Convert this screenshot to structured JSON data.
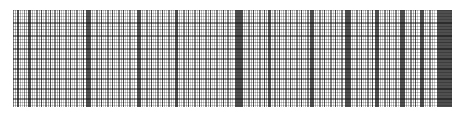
{
  "image": {
    "kind": "barcode-strip",
    "width": 464,
    "height": 120,
    "background_color": "#ffffff",
    "alt_text": "Dense vertical barcode-like stripe pattern crossed by faint horizontal grid rules"
  },
  "plot": {
    "x": 13,
    "y": 10,
    "width": 439,
    "height": 97,
    "background_color": "#ffffff"
  },
  "palette": {
    "background": "#ffffff",
    "lightest_bar": "#c9c9c9",
    "light_bar": "#b4b4b4",
    "mid_bar": "#969696",
    "dark_bar": "#6e6e6e",
    "darkest_bar": "#4f4f4f",
    "rule": "#8c8c8c"
  },
  "chart_data": {
    "type": "bar",
    "title": "",
    "subtitle": "",
    "xlabel": "",
    "ylabel": "",
    "grid": true,
    "legend": "none",
    "xlim": [
      13,
      452
    ],
    "ylim": [
      10,
      107
    ],
    "tick_labels_x": [],
    "tick_labels_y": [],
    "annotations": [],
    "bar_axis": "vertical",
    "bar_span_y": [
      10,
      107
    ],
    "bars": [
      [
        13,
        1,
        3
      ],
      [
        15,
        1,
        2
      ],
      [
        17,
        2,
        4
      ],
      [
        20,
        1,
        2
      ],
      [
        22,
        1,
        1
      ],
      [
        24,
        1,
        3
      ],
      [
        26,
        1,
        2
      ],
      [
        28,
        3,
        4
      ],
      [
        32,
        1,
        2
      ],
      [
        34,
        1,
        1
      ],
      [
        36,
        2,
        3
      ],
      [
        39,
        1,
        2
      ],
      [
        41,
        1,
        4
      ],
      [
        43,
        1,
        1
      ],
      [
        45,
        2,
        3
      ],
      [
        48,
        1,
        2
      ],
      [
        50,
        1,
        4
      ],
      [
        52,
        1,
        1
      ],
      [
        54,
        2,
        3
      ],
      [
        57,
        1,
        2
      ],
      [
        59,
        1,
        4
      ],
      [
        61,
        1,
        2
      ],
      [
        63,
        1,
        1
      ],
      [
        65,
        2,
        3
      ],
      [
        68,
        1,
        2
      ],
      [
        70,
        1,
        4
      ],
      [
        72,
        1,
        1
      ],
      [
        74,
        1,
        2
      ],
      [
        76,
        2,
        3
      ],
      [
        79,
        1,
        1
      ],
      [
        81,
        1,
        2
      ],
      [
        83,
        1,
        4
      ],
      [
        86,
        5,
        4
      ],
      [
        92,
        1,
        2
      ],
      [
        94,
        1,
        1
      ],
      [
        96,
        2,
        3
      ],
      [
        99,
        1,
        2
      ],
      [
        101,
        1,
        4
      ],
      [
        103,
        1,
        1
      ],
      [
        105,
        1,
        2
      ],
      [
        107,
        2,
        3
      ],
      [
        110,
        1,
        1
      ],
      [
        112,
        1,
        4
      ],
      [
        114,
        1,
        2
      ],
      [
        116,
        1,
        1
      ],
      [
        118,
        2,
        3
      ],
      [
        121,
        1,
        2
      ],
      [
        123,
        1,
        4
      ],
      [
        125,
        1,
        1
      ],
      [
        127,
        1,
        2
      ],
      [
        129,
        2,
        3
      ],
      [
        132,
        1,
        1
      ],
      [
        134,
        1,
        2
      ],
      [
        137,
        4,
        4
      ],
      [
        142,
        1,
        2
      ],
      [
        144,
        1,
        1
      ],
      [
        146,
        2,
        3
      ],
      [
        149,
        1,
        2
      ],
      [
        151,
        1,
        4
      ],
      [
        153,
        1,
        1
      ],
      [
        155,
        1,
        2
      ],
      [
        157,
        2,
        3
      ],
      [
        160,
        1,
        1
      ],
      [
        162,
        1,
        4
      ],
      [
        164,
        1,
        2
      ],
      [
        166,
        1,
        1
      ],
      [
        168,
        2,
        3
      ],
      [
        171,
        1,
        2
      ],
      [
        173,
        1,
        1
      ],
      [
        175,
        3,
        4
      ],
      [
        179,
        1,
        2
      ],
      [
        181,
        1,
        1
      ],
      [
        183,
        2,
        3
      ],
      [
        186,
        1,
        2
      ],
      [
        188,
        1,
        4
      ],
      [
        190,
        1,
        1
      ],
      [
        192,
        1,
        2
      ],
      [
        194,
        2,
        3
      ],
      [
        197,
        1,
        1
      ],
      [
        199,
        1,
        4
      ],
      [
        201,
        1,
        2
      ],
      [
        203,
        1,
        1
      ],
      [
        205,
        2,
        3
      ],
      [
        208,
        1,
        2
      ],
      [
        210,
        1,
        4
      ],
      [
        212,
        1,
        1
      ],
      [
        214,
        1,
        2
      ],
      [
        216,
        2,
        3
      ],
      [
        219,
        1,
        1
      ],
      [
        221,
        1,
        2
      ],
      [
        223,
        1,
        4
      ],
      [
        225,
        1,
        1
      ],
      [
        227,
        2,
        3
      ],
      [
        230,
        1,
        2
      ],
      [
        232,
        1,
        1
      ],
      [
        235,
        8,
        4
      ],
      [
        244,
        1,
        2
      ],
      [
        246,
        1,
        1
      ],
      [
        248,
        2,
        3
      ],
      [
        251,
        1,
        2
      ],
      [
        253,
        1,
        4
      ],
      [
        255,
        1,
        1
      ],
      [
        257,
        1,
        2
      ],
      [
        259,
        2,
        3
      ],
      [
        262,
        1,
        1
      ],
      [
        264,
        1,
        4
      ],
      [
        266,
        1,
        2
      ],
      [
        268,
        3,
        4
      ],
      [
        272,
        1,
        1
      ],
      [
        274,
        2,
        3
      ],
      [
        277,
        1,
        2
      ],
      [
        279,
        1,
        4
      ],
      [
        281,
        1,
        1
      ],
      [
        283,
        1,
        2
      ],
      [
        285,
        2,
        3
      ],
      [
        288,
        1,
        1
      ],
      [
        290,
        1,
        4
      ],
      [
        292,
        1,
        2
      ],
      [
        294,
        1,
        1
      ],
      [
        296,
        2,
        3
      ],
      [
        299,
        1,
        2
      ],
      [
        301,
        1,
        4
      ],
      [
        303,
        1,
        1
      ],
      [
        305,
        1,
        2
      ],
      [
        307,
        2,
        3
      ],
      [
        310,
        4,
        4
      ],
      [
        315,
        1,
        2
      ],
      [
        317,
        1,
        1
      ],
      [
        319,
        2,
        3
      ],
      [
        322,
        1,
        2
      ],
      [
        324,
        1,
        4
      ],
      [
        326,
        1,
        1
      ],
      [
        328,
        1,
        2
      ],
      [
        330,
        2,
        3
      ],
      [
        333,
        1,
        1
      ],
      [
        335,
        1,
        4
      ],
      [
        337,
        1,
        2
      ],
      [
        339,
        1,
        1
      ],
      [
        341,
        2,
        3
      ],
      [
        345,
        6,
        4
      ],
      [
        352,
        1,
        2
      ],
      [
        354,
        1,
        1
      ],
      [
        356,
        2,
        3
      ],
      [
        359,
        1,
        2
      ],
      [
        361,
        1,
        4
      ],
      [
        363,
        1,
        1
      ],
      [
        365,
        1,
        2
      ],
      [
        367,
        2,
        3
      ],
      [
        370,
        1,
        1
      ],
      [
        372,
        1,
        4
      ],
      [
        375,
        4,
        4
      ],
      [
        380,
        1,
        2
      ],
      [
        382,
        1,
        1
      ],
      [
        384,
        2,
        3
      ],
      [
        387,
        1,
        2
      ],
      [
        389,
        1,
        4
      ],
      [
        391,
        1,
        1
      ],
      [
        393,
        1,
        2
      ],
      [
        395,
        2,
        3
      ],
      [
        398,
        1,
        1
      ],
      [
        400,
        5,
        4
      ],
      [
        406,
        1,
        2
      ],
      [
        408,
        1,
        1
      ],
      [
        410,
        2,
        3
      ],
      [
        413,
        1,
        2
      ],
      [
        415,
        1,
        4
      ],
      [
        417,
        1,
        1
      ],
      [
        420,
        4,
        4
      ],
      [
        425,
        1,
        2
      ],
      [
        427,
        1,
        1
      ],
      [
        429,
        2,
        3
      ],
      [
        432,
        1,
        2
      ],
      [
        434,
        1,
        1
      ],
      [
        437,
        15,
        4
      ]
    ],
    "rule_span_x": [
      13,
      452
    ],
    "rules": [
      [
        10,
        1,
        1
      ],
      [
        13,
        1,
        0
      ],
      [
        16,
        1,
        1
      ],
      [
        19,
        1,
        0
      ],
      [
        22,
        2,
        3
      ],
      [
        26,
        1,
        1
      ],
      [
        29,
        1,
        2
      ],
      [
        32,
        1,
        0
      ],
      [
        35,
        2,
        3
      ],
      [
        39,
        1,
        1
      ],
      [
        42,
        1,
        2
      ],
      [
        45,
        1,
        0
      ],
      [
        48,
        2,
        3
      ],
      [
        52,
        1,
        1
      ],
      [
        55,
        1,
        0
      ],
      [
        58,
        2,
        3
      ],
      [
        62,
        1,
        1
      ],
      [
        65,
        1,
        0
      ],
      [
        68,
        2,
        3
      ],
      [
        72,
        1,
        1
      ],
      [
        75,
        1,
        0
      ],
      [
        78,
        2,
        3
      ],
      [
        82,
        1,
        1
      ],
      [
        85,
        1,
        0
      ],
      [
        88,
        2,
        3
      ],
      [
        92,
        1,
        1
      ],
      [
        95,
        1,
        0
      ],
      [
        98,
        2,
        3
      ],
      [
        102,
        1,
        1
      ],
      [
        105,
        1,
        0
      ]
    ]
  }
}
